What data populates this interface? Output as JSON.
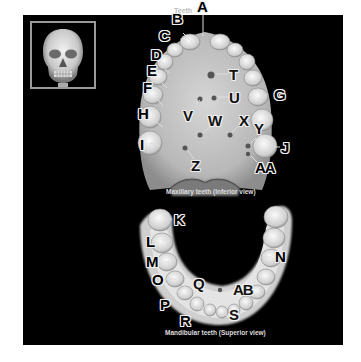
{
  "figure": {
    "thumbnail": {
      "subject": "skull-anterior-view"
    },
    "maxillary": {
      "caption": "Maxillary teeth (Inferior view)",
      "teeth_label": "Teeth",
      "labels": [
        "A",
        "B",
        "C",
        "D",
        "E",
        "F",
        "G",
        "H",
        "I",
        "J",
        "T",
        "U",
        "V",
        "W",
        "X",
        "Y",
        "Z",
        "AA"
      ]
    },
    "mandibular": {
      "caption": "Mandibular teeth (Superior view)",
      "labels": [
        "K",
        "L",
        "M",
        "N",
        "O",
        "P",
        "Q",
        "R",
        "S",
        "AB"
      ]
    }
  }
}
